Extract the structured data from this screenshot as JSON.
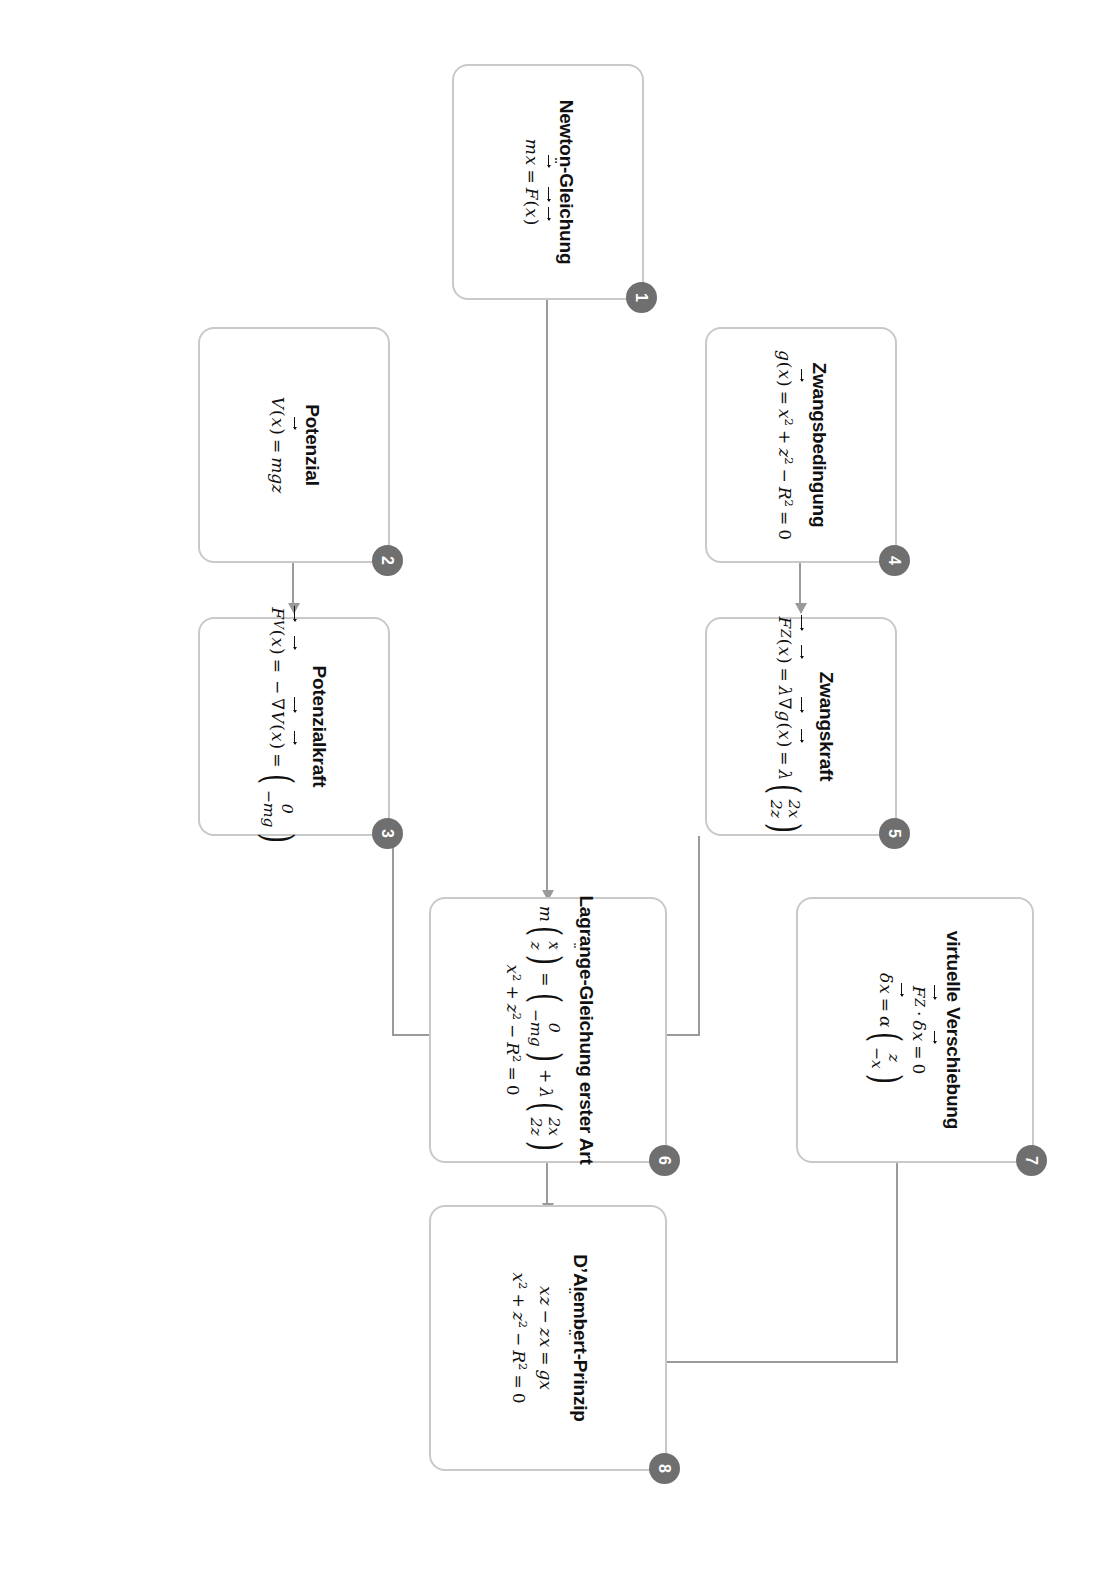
{
  "diagram": {
    "language": "de",
    "accent_color": "#6f6f6f",
    "box_border_color": "#c9c9c9",
    "connector_color": "#9a9a9a",
    "rotation_degrees": 90
  },
  "nodes": [
    {
      "id": "1",
      "badge": "1",
      "title": "Newton-Gleichung",
      "equations": [
        {
          "id": "eq1a",
          "m": "m",
          "xddot": "x",
          "eq": "=",
          "F": "F",
          "arg": "(",
          "argx": "x",
          "argclose": ")"
        }
      ],
      "plain": "m ẍ⃗ = F⃗(x⃗)"
    },
    {
      "id": "2",
      "badge": "2",
      "title": "Potenzial",
      "plain": "V(x⃗) = mgz",
      "parts": {
        "V": "V",
        "x": "x",
        "eq": "=",
        "rhs": "mgz"
      }
    },
    {
      "id": "3",
      "badge": "3",
      "title": "Potenzialkraft",
      "plain": "F⃗_V(x⃗) = −∇⃗V(x⃗) = (0, −mg)",
      "parts": {
        "F": "F",
        "sub": "V",
        "x": "x",
        "eq1": "=",
        "minus": "−",
        "nabla": "∇",
        "V": "V",
        "x2": "x",
        "eq2": "=",
        "vec_top": "0",
        "vec_bottom": "−mg"
      }
    },
    {
      "id": "4",
      "badge": "4",
      "title": "Zwangsbedingung",
      "plain": "g(x⃗) = x² + z² − R² = 0",
      "parts": {
        "g": "g",
        "x": "x",
        "eq1": "=",
        "x2": "x",
        "exp2a": "2",
        "plus": "+",
        "z": "z",
        "exp2b": "2",
        "minus": "−",
        "R": "R",
        "exp2c": "2",
        "eq2": "=",
        "zero": "0"
      }
    },
    {
      "id": "5",
      "badge": "5",
      "title": "Zwangskraft",
      "plain": "F⃗_Z(x⃗) = λ∇⃗g(x⃗) = λ(2x, 2z)",
      "parts": {
        "F": "F",
        "sub": "Z",
        "x": "x",
        "eq1": "=",
        "lambda": "λ",
        "nabla": "∇",
        "g": "g",
        "x2": "x",
        "eq2": "=",
        "lambda2": "λ",
        "vec_top": "2x",
        "vec_bottom": "2z"
      }
    },
    {
      "id": "6",
      "badge": "6",
      "title": "Lagrange-Gleichung erster Art",
      "plain": "m(ẍ, z̈) = (0, −mg) + λ(2x, 2z);  x² + z² − R² = 0",
      "parts": {
        "m": "m",
        "xddot": "x",
        "zddot": "z",
        "eq": "=",
        "v1_top": "0",
        "v1_bottom": "−mg",
        "plus": "+",
        "lambda": "λ",
        "v2_top": "2x",
        "v2_bottom": "2z"
      },
      "constraint": {
        "x": "x",
        "exp2a": "2",
        "plus": "+",
        "z": "z",
        "exp2b": "2",
        "minus": "−",
        "R": "R",
        "exp2c": "2",
        "eq": "=",
        "zero": "0"
      }
    },
    {
      "id": "7",
      "badge": "7",
      "title": "virtuelle Verschiebung",
      "plain": "F⃗_Z · δx⃗ = 0;  δx⃗ = α(z, −x)",
      "parts": {
        "F": "F",
        "sub": "Z",
        "dot": "·",
        "delta": "δ",
        "x": "x",
        "eq": "=",
        "zero": "0"
      },
      "second": {
        "delta": "δ",
        "x": "x",
        "eq": "=",
        "alpha": "α",
        "vec_top": "z",
        "vec_bottom": "−x"
      }
    },
    {
      "id": "8",
      "badge": "8",
      "title": "D’Alembert-Prinzip",
      "plain": "ẍz − z̈x = gx;  x² + z² − R² = 0",
      "parts": {
        "xddot": "x",
        "z": "z",
        "minus": "−",
        "zddot": "z",
        "x": "x",
        "eq": "=",
        "rhs": "gx"
      },
      "constraint": {
        "x": "x",
        "exp2a": "2",
        "plus": "+",
        "z": "z",
        "exp2b": "2",
        "minus": "−",
        "R": "R",
        "exp2c": "2",
        "eq": "=",
        "zero": "0"
      }
    }
  ],
  "connections": [
    {
      "from": "1",
      "to": "6",
      "type": "straight-right"
    },
    {
      "from": "2",
      "to": "3",
      "type": "straight-right"
    },
    {
      "from": "3",
      "to": "6",
      "type": "elbow-right-up"
    },
    {
      "from": "4",
      "to": "5",
      "type": "straight-right"
    },
    {
      "from": "5",
      "to": "6",
      "type": "elbow-right-down"
    },
    {
      "from": "6",
      "to": "8",
      "type": "straight-right"
    },
    {
      "from": "7",
      "to": "8",
      "type": "elbow-right-down"
    }
  ]
}
